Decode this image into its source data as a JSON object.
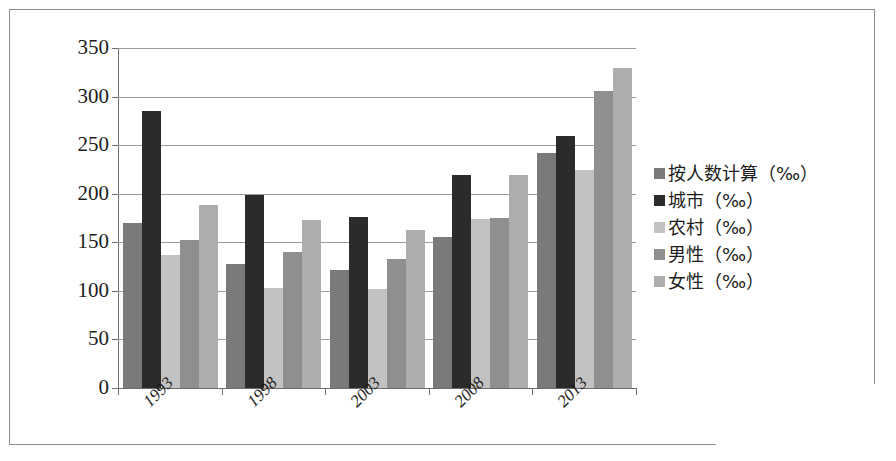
{
  "chart_data": {
    "type": "bar",
    "title": "",
    "subtitle": "",
    "xlabel": "",
    "ylabel": "",
    "categories": [
      "1993",
      "1998",
      "2003",
      "2008",
      "2013"
    ],
    "ylim": [
      0,
      350
    ],
    "yticks": [
      0,
      50,
      100,
      150,
      200,
      250,
      300,
      350
    ],
    "ytick_labels": [
      "0",
      "50",
      "100",
      "150",
      "200",
      "250",
      "300",
      "350"
    ],
    "grid": true,
    "legend_position": "right",
    "series": [
      {
        "name": "按人数计算（‰）",
        "color": "#7a7a7a",
        "values": [
          170,
          128,
          122,
          155,
          242
        ]
      },
      {
        "name": "城市（‰）",
        "color": "#2b2b2b",
        "values": [
          285,
          199,
          176,
          219,
          259
        ]
      },
      {
        "name": "农村（‰）",
        "color": "#c2c2c2",
        "values": [
          137,
          103,
          102,
          174,
          224
        ]
      },
      {
        "name": "男性（‰）",
        "color": "#8f8f8f",
        "values": [
          152,
          140,
          133,
          175,
          306
        ]
      },
      {
        "name": "女性（‰）",
        "color": "#aeaeae",
        "values": [
          188,
          173,
          163,
          219,
          329
        ]
      }
    ]
  }
}
